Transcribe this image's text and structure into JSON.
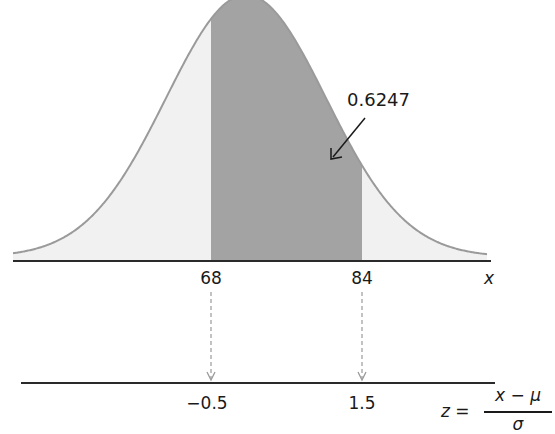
{
  "chart_data": {
    "type": "area",
    "title": "",
    "distribution": {
      "mean": 72,
      "sd": 8
    },
    "shaded_interval": {
      "x_low": 68,
      "x_high": 84,
      "z_low": -0.5,
      "z_high": 1.5,
      "area": 0.6247
    },
    "x_axis": {
      "label": "x",
      "ticks": [
        "68",
        "84"
      ]
    },
    "z_axis": {
      "ticks": [
        "−0.5",
        "1.5"
      ]
    },
    "annotation": "0.6247",
    "formula": "z = (x − μ) / σ",
    "colors": {
      "shaded": "#a3a3a3",
      "unshaded": "#f1f1f1",
      "curve": "#9a9a9a",
      "axis": "#2a2a2a",
      "connector": "#9a9a9a"
    }
  },
  "diagram": {
    "area_label": "0.6247",
    "x_axis": {
      "variable": "x",
      "ticks": [
        {
          "label": "68"
        },
        {
          "label": "84"
        }
      ]
    },
    "z_axis": {
      "ticks": [
        {
          "label": "−0.5"
        },
        {
          "label": "1.5"
        }
      ]
    },
    "formula": {
      "lhs": "z =",
      "numerator": "x − μ",
      "denominator": "σ"
    }
  }
}
